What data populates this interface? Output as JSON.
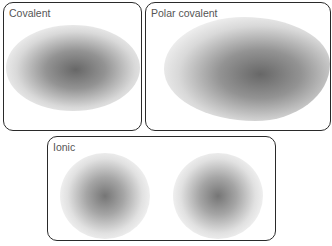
{
  "panels": {
    "covalent": {
      "label": "Covalent"
    },
    "polar_covalent": {
      "label": "Polar covalent"
    },
    "ionic": {
      "label": "Ionic"
    }
  },
  "colors": {
    "border": "#2a2a2a",
    "cloud": "#5f5f5f",
    "label": "#555555"
  }
}
